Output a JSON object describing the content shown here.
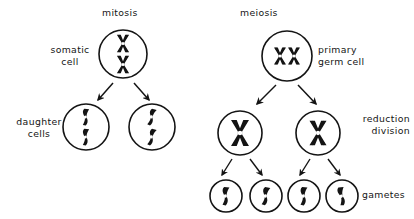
{
  "figure": {
    "title_mitosis": "mitosis",
    "title_meiosis": "meiosis",
    "background_color": "#ffffff",
    "ink_color": "#141414"
  },
  "labels": {
    "mitosis": {
      "text": "mitosis",
      "x": 102,
      "y": 7
    },
    "meiosis": {
      "text": "meiosis",
      "x": 240,
      "y": 7
    },
    "somatic_cell": {
      "text": "somatic\ncell",
      "x": 42,
      "y": 44
    },
    "daughter_cells": {
      "text": "daughter\ncells",
      "x": 10,
      "y": 116
    },
    "primary_germ_cell": {
      "text": "primary\ngerm cell",
      "x": 318,
      "y": 44
    },
    "reduction_division": {
      "text": "reduction\ndivision",
      "x": 351,
      "y": 113
    },
    "gametes": {
      "text": "gametes",
      "x": 362,
      "y": 189
    }
  },
  "cells": {
    "somatic": {
      "cx": 123,
      "cy": 54,
      "r": 24,
      "chromosomes": 2,
      "type": "duplicated-x",
      "arrangement": "vertical"
    },
    "daughter_left": {
      "cx": 86,
      "cy": 127,
      "r": 23,
      "chromosomes": 2,
      "type": "single-rod",
      "arrangement": "vertical"
    },
    "daughter_right": {
      "cx": 152,
      "cy": 127,
      "r": 23,
      "chromosomes": 2,
      "type": "single-rod",
      "arrangement": "vertical"
    },
    "primary_germ": {
      "cx": 287,
      "cy": 56,
      "r": 25,
      "chromosomes": 2,
      "type": "duplicated-x",
      "arrangement": "horizontal-pair"
    },
    "reduction_left": {
      "cx": 240,
      "cy": 133,
      "r": 22,
      "chromosomes": 1,
      "type": "duplicated-x",
      "arrangement": "single"
    },
    "reduction_right": {
      "cx": 318,
      "cy": 133,
      "r": 22,
      "chromosomes": 1,
      "type": "duplicated-x",
      "arrangement": "single"
    },
    "gamete_1": {
      "cx": 226,
      "cy": 196,
      "r": 16,
      "chromosomes": 1,
      "type": "single-rod",
      "arrangement": "single"
    },
    "gamete_2": {
      "cx": 266,
      "cy": 196,
      "r": 16,
      "chromosomes": 1,
      "type": "single-rod",
      "arrangement": "single"
    },
    "gamete_3": {
      "cx": 304,
      "cy": 196,
      "r": 16,
      "chromosomes": 1,
      "type": "single-rod",
      "arrangement": "single"
    },
    "gamete_4": {
      "cx": 342,
      "cy": 196,
      "r": 16,
      "chromosomes": 1,
      "type": "single-rod",
      "arrangement": "single"
    }
  },
  "arrows": {
    "mitosis_left": {
      "x1": 113,
      "y1": 83,
      "x2": 98,
      "y2": 100
    },
    "mitosis_right": {
      "x1": 134,
      "y1": 83,
      "x2": 149,
      "y2": 100
    },
    "meiosis_left": {
      "x1": 276,
      "y1": 85,
      "x2": 257,
      "y2": 104
    },
    "meiosis_right": {
      "x1": 298,
      "y1": 85,
      "x2": 315,
      "y2": 104
    },
    "gamete_1_arrow": {
      "x1": 232,
      "y1": 159,
      "x2": 222,
      "y2": 175
    },
    "gamete_2_arrow": {
      "x1": 250,
      "y1": 159,
      "x2": 262,
      "y2": 175
    },
    "gamete_3_arrow": {
      "x1": 310,
      "y1": 159,
      "x2": 300,
      "y2": 175
    },
    "gamete_4_arrow": {
      "x1": 328,
      "y1": 159,
      "x2": 340,
      "y2": 175
    }
  }
}
